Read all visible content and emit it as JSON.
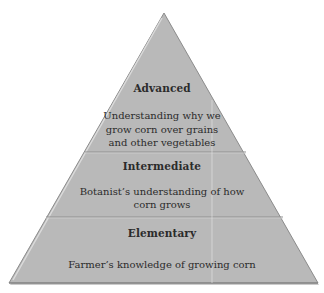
{
  "diagram": {
    "type": "pyramid",
    "colors": {
      "fill": "#b9b9b9",
      "edge": "#8c8c8c",
      "highlight": "#e4e4e4",
      "divider": "#8f8f8f",
      "text": "#2b2b2b"
    },
    "levels": [
      {
        "title": "Advanced",
        "description": [
          "Understanding why we",
          "grow corn over grains",
          "and other vegetables"
        ]
      },
      {
        "title": "Intermediate",
        "description": [
          "Botanist’s understanding of how",
          "corn grows"
        ]
      },
      {
        "title": "Elementary",
        "description": [
          "Farmer’s knowledge of growing corn"
        ]
      }
    ]
  }
}
